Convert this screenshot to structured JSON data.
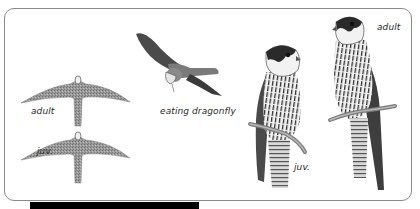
{
  "figure": {
    "labels": {
      "flight_adult": "adult",
      "flight_juv": "juv.",
      "eating": "eating dragonfly",
      "perched_juv": "juv.",
      "perched_adult": "adult"
    },
    "colors": {
      "frame_border": "#8a8a8a",
      "background": "#ffffff",
      "bar": "#000000",
      "plumage_dark": "#3a3a3a",
      "plumage_mid": "#8c8c8c",
      "plumage_light": "#e8e8e8"
    }
  }
}
